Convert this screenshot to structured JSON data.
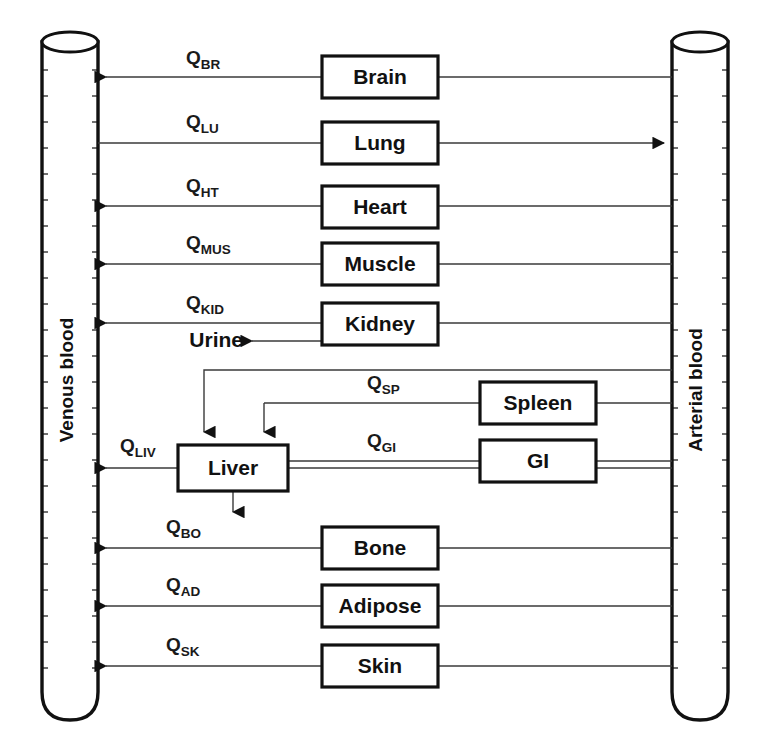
{
  "diagram": {
    "type": "flow-diagram",
    "background_color": "#ffffff",
    "line_color": "#333333",
    "box_stroke_color": "#111111"
  },
  "vessels": [
    {
      "id": "venous",
      "label": "Venous blood",
      "side": "left",
      "x": 42,
      "y": 30,
      "width": 56,
      "height": 690
    },
    {
      "id": "arterial",
      "label": "Arterial blood",
      "side": "right",
      "x": 672,
      "y": 30,
      "width": 56,
      "height": 690
    }
  ],
  "organs": [
    {
      "id": "brain",
      "label": "Brain",
      "x": 322,
      "y": 56,
      "width": 116,
      "height": 42
    },
    {
      "id": "lung",
      "label": "Lung",
      "x": 322,
      "y": 122,
      "width": 116,
      "height": 42
    },
    {
      "id": "heart",
      "label": "Heart",
      "x": 322,
      "y": 186,
      "width": 116,
      "height": 42
    },
    {
      "id": "muscle",
      "label": "Muscle",
      "x": 322,
      "y": 243,
      "width": 116,
      "height": 42
    },
    {
      "id": "kidney",
      "label": "Kidney",
      "x": 322,
      "y": 303,
      "width": 116,
      "height": 42
    },
    {
      "id": "spleen",
      "label": "Spleen",
      "x": 480,
      "y": 382,
      "width": 116,
      "height": 42
    },
    {
      "id": "gi",
      "label": "GI",
      "x": 480,
      "y": 440,
      "width": 116,
      "height": 42
    },
    {
      "id": "liver",
      "label": "Liver",
      "x": 178,
      "y": 445,
      "width": 110,
      "height": 46
    },
    {
      "id": "bone",
      "label": "Bone",
      "x": 322,
      "y": 527,
      "width": 116,
      "height": 42
    },
    {
      "id": "adipose",
      "label": "Adipose",
      "x": 322,
      "y": 585,
      "width": 116,
      "height": 42
    },
    {
      "id": "skin",
      "label": "Skin",
      "x": 322,
      "y": 645,
      "width": 116,
      "height": 42
    }
  ],
  "flows": [
    {
      "id": "q-br",
      "symbol": "Q",
      "subscript": "BR",
      "organ": "brain",
      "label_x": 186,
      "label_y": 64,
      "line_y": 77
    },
    {
      "id": "q-lu",
      "symbol": "Q",
      "subscript": "LU",
      "organ": "lung",
      "label_x": 186,
      "label_y": 128,
      "line_y": 143
    },
    {
      "id": "q-ht",
      "symbol": "Q",
      "subscript": "HT",
      "organ": "heart",
      "label_x": 186,
      "label_y": 192,
      "line_y": 206
    },
    {
      "id": "q-mus",
      "symbol": "Q",
      "subscript": "MUS",
      "organ": "muscle",
      "label_x": 186,
      "label_y": 249,
      "line_y": 264
    },
    {
      "id": "q-kid",
      "symbol": "Q",
      "subscript": "KID",
      "organ": "kidney",
      "label_x": 186,
      "label_y": 309,
      "line_y": 323
    },
    {
      "id": "q-sp",
      "symbol": "Q",
      "subscript": "SP",
      "organ": "spleen",
      "label_x": 367,
      "label_y": 389,
      "line_y": 403
    },
    {
      "id": "q-gi",
      "symbol": "Q",
      "subscript": "GI",
      "organ": "gi",
      "label_x": 367,
      "label_y": 447,
      "line_y": 461
    },
    {
      "id": "q-liv",
      "symbol": "Q",
      "subscript": "LIV",
      "organ": "liver",
      "label_x": 120,
      "label_y": 452,
      "line_y": 468
    },
    {
      "id": "q-bo",
      "symbol": "Q",
      "subscript": "BO",
      "organ": "bone",
      "label_x": 166,
      "label_y": 533,
      "line_y": 548
    },
    {
      "id": "q-ad",
      "symbol": "Q",
      "subscript": "AD",
      "organ": "adipose",
      "label_x": 166,
      "label_y": 591,
      "line_y": 606
    },
    {
      "id": "q-sk",
      "symbol": "Q",
      "subscript": "SK",
      "organ": "skin",
      "label_x": 166,
      "label_y": 651,
      "line_y": 666
    }
  ],
  "excretions": [
    {
      "id": "urine",
      "label": "Urine",
      "from": "kidney",
      "x": 243,
      "y": 341
    },
    {
      "id": "bile",
      "label": "",
      "from": "liver",
      "x": 233,
      "y": 520
    }
  ]
}
